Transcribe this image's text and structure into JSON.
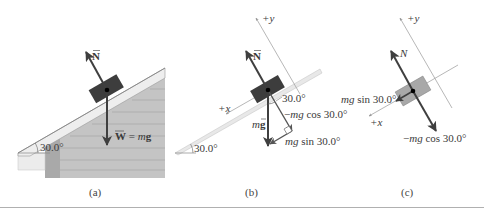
{
  "figure": {
    "panels": [
      {
        "id": "a",
        "caption": "(a)",
        "angle_label": "30.0°",
        "normal_label": "N",
        "weight_label": "W = mg",
        "weight_label_lhs": "W",
        "weight_label_eq": " = ",
        "weight_label_m": "m",
        "weight_label_g": "g"
      },
      {
        "id": "b",
        "caption": "(b)",
        "angle_label": "30.0°",
        "inner_angle_label": "30.0°",
        "normal_label": "N",
        "y_axis_label": "+y",
        "x_axis_label": "+x",
        "gravity_label_m": "m",
        "gravity_label_g": "g",
        "cos_component_label": "−mg cos 30.0°",
        "cos_component_prefix": "−",
        "cos_component_mg": "mg",
        "cos_component_rest": " cos 30.0°",
        "sin_component_mg": "mg",
        "sin_component_rest": " sin 30.0°"
      },
      {
        "id": "c",
        "caption": "(c)",
        "normal_label": "N",
        "y_axis_label": "+y",
        "x_axis_label": "+x",
        "sin_component_mg": "mg",
        "sin_component_rest": " sin 30.0°",
        "cos_component_prefix": "−",
        "cos_component_mg": "mg",
        "cos_component_rest": " cos 30.0°"
      }
    ],
    "colors": {
      "block": "#3d3d3d",
      "block_light": "#a8a8a8",
      "arrow": "#3f3f3f",
      "roof": "#eeeeee",
      "siding": "#bcbcbc",
      "siding_dark": "#a3a3a3",
      "axis": "#9a9a9a",
      "rule": "#b0b0b0"
    }
  }
}
